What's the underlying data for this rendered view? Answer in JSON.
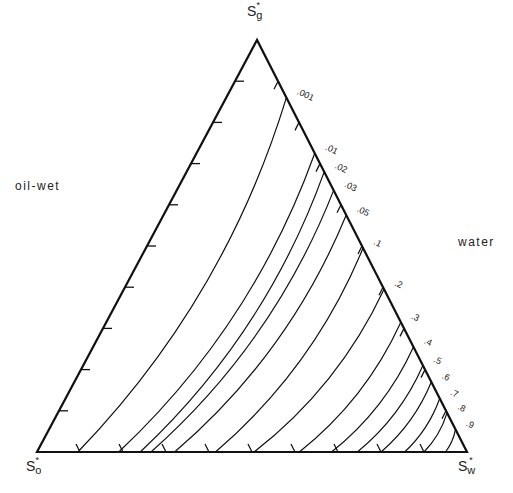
{
  "chart_data": {
    "type": "ternary-contour",
    "title": "",
    "vertices": {
      "top": {
        "label": "S",
        "sub": "g",
        "sup": "*"
      },
      "bottom_left": {
        "label": "S",
        "sub": "o",
        "sup": "*"
      },
      "bottom_right": {
        "label": "S",
        "sub": "w",
        "sup": "*"
      }
    },
    "side_labels": {
      "left": "oil-wet",
      "right": "water"
    },
    "contour_levels": [
      ".001",
      ".01",
      ".02",
      ".03",
      ".05",
      ".1",
      ".2",
      ".3",
      ".4",
      ".5",
      ".6",
      ".7",
      ".8",
      ".9"
    ],
    "contours": [
      {
        "level": ".001",
        "right_edge_frac": 0.14,
        "bottom_frac": 0.095
      },
      {
        "level": ".01",
        "right_edge_frac": 0.275,
        "bottom_frac": 0.19
      },
      {
        "level": ".02",
        "right_edge_frac": 0.32,
        "bottom_frac": 0.24
      },
      {
        "level": ".03",
        "right_edge_frac": 0.365,
        "bottom_frac": 0.265
      },
      {
        "level": ".05",
        "right_edge_frac": 0.425,
        "bottom_frac": 0.32
      },
      {
        "level": ".1",
        "right_edge_frac": 0.505,
        "bottom_frac": 0.415
      },
      {
        "level": ".2",
        "right_edge_frac": 0.605,
        "bottom_frac": 0.505
      },
      {
        "level": ".3",
        "right_edge_frac": 0.685,
        "bottom_frac": 0.61
      },
      {
        "level": ".4",
        "right_edge_frac": 0.745,
        "bottom_frac": 0.685
      },
      {
        "level": ".5",
        "right_edge_frac": 0.79,
        "bottom_frac": 0.745
      },
      {
        "level": ".6",
        "right_edge_frac": 0.83,
        "bottom_frac": 0.8
      },
      {
        "level": ".7",
        "right_edge_frac": 0.87,
        "bottom_frac": 0.855
      },
      {
        "level": ".8",
        "right_edge_frac": 0.905,
        "bottom_frac": 0.9
      },
      {
        "level": ".9",
        "right_edge_frac": 0.945,
        "bottom_frac": 0.95
      }
    ],
    "ticks_per_edge": 10,
    "grid": false,
    "legend": "none"
  }
}
